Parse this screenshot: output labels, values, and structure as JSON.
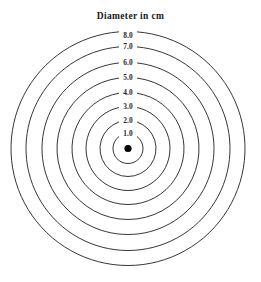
{
  "figure": {
    "title": "Diameter in cm",
    "background_color": "#ffffff",
    "line_color": "#2b2b2b",
    "label_color": "#1f1f1f",
    "center_dot_color": "#000000"
  },
  "chart_data": {
    "type": "scatter",
    "title": "Diameter in cm",
    "subtitle": "",
    "xlabel": "",
    "ylabel": "",
    "grid": false,
    "legend_position": "none",
    "units": "cm",
    "center": {
      "x": 128,
      "y": 148.5
    },
    "categories": [
      "1.0",
      "2.0",
      "3.0",
      "4.0",
      "5.0",
      "6.0",
      "7.0",
      "8.0"
    ],
    "values": [
      1.0,
      2.0,
      3.0,
      4.0,
      5.0,
      6.0,
      7.0,
      8.0
    ],
    "series": [
      {
        "name": "Diameter in cm",
        "values": [
          1.0,
          2.0,
          3.0,
          4.0,
          5.0,
          6.0,
          7.0,
          8.0
        ]
      },
      {
        "name": "Pixel radius",
        "values": [
          15,
          28,
          42,
          56,
          71,
          86,
          102,
          117
        ]
      }
    ],
    "rings": [
      {
        "label": "1.0",
        "diameter_cm": 1.0,
        "radius_px": 15,
        "label_x": 128,
        "label_y": 133.5
      },
      {
        "label": "2.0",
        "diameter_cm": 2.0,
        "radius_px": 28,
        "label_x": 128,
        "label_y": 120.5
      },
      {
        "label": "3.0",
        "diameter_cm": 3.0,
        "radius_px": 42,
        "label_x": 128,
        "label_y": 106.5
      },
      {
        "label": "4.0",
        "diameter_cm": 4.0,
        "radius_px": 56,
        "label_x": 128,
        "label_y": 92.5
      },
      {
        "label": "5.0",
        "diameter_cm": 5.0,
        "radius_px": 71,
        "label_x": 128,
        "label_y": 77.5
      },
      {
        "label": "6.0",
        "diameter_cm": 6.0,
        "radius_px": 86,
        "label_x": 128,
        "label_y": 62.5
      },
      {
        "label": "7.0",
        "diameter_cm": 7.0,
        "radius_px": 102,
        "label_x": 128,
        "label_y": 46.5
      },
      {
        "label": "8.0",
        "diameter_cm": 8.0,
        "radius_px": 117,
        "label_x": 128,
        "label_y": 35.5
      }
    ],
    "center_marker": {
      "label": "",
      "radius_px": 3.6
    }
  }
}
